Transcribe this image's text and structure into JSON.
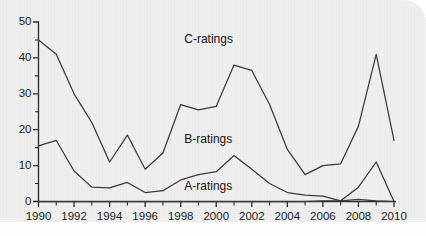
{
  "chart_data": {
    "type": "line",
    "title": "",
    "subtitle": "",
    "xlabel": "",
    "ylabel": "",
    "xlim": [
      1990,
      2010
    ],
    "ylim": [
      0,
      50
    ],
    "grid": false,
    "legend_position": "inline-annotations",
    "y_ticks_major": [
      0,
      10,
      20,
      30,
      40,
      50
    ],
    "y_ticks_minor": [
      5,
      15,
      25,
      35,
      45
    ],
    "x_ticks": [
      1990,
      1991,
      1992,
      1993,
      1994,
      1995,
      1996,
      1997,
      1998,
      1999,
      2000,
      2001,
      2002,
      2003,
      2004,
      2005,
      2006,
      2007,
      2008,
      2009,
      2010
    ],
    "x_tick_labels": [
      "1990",
      "",
      "1992",
      "",
      "1994",
      "",
      "1996",
      "",
      "1998",
      "",
      "2000",
      "",
      "2002",
      "",
      "2004",
      "",
      "2006",
      "",
      "2008",
      "",
      "2010"
    ],
    "x_labels_shown": [
      "1990",
      "1992",
      "1994",
      "1996",
      "1998",
      "2000",
      "2002",
      "2004",
      "2006",
      "2008",
      "2010"
    ],
    "y_tick_labels": [
      "0",
      "10",
      "20",
      "30",
      "40",
      "50"
    ],
    "line_color": "#3a3a3a",
    "axis_color": "#2b2b2b",
    "background_color": "#f0f0f0",
    "x": [
      1990,
      1991,
      1992,
      1993,
      1994,
      1995,
      1996,
      1997,
      1998,
      1999,
      2000,
      2001,
      2002,
      2003,
      2004,
      2005,
      2006,
      2007,
      2008,
      2009,
      2010
    ],
    "series": [
      {
        "name": "C-ratings",
        "label": "C-ratings",
        "label_x": 2000,
        "label_y": 45,
        "values": [
          45,
          41,
          30,
          22,
          11,
          18.5,
          9,
          13.5,
          27,
          25.5,
          26.5,
          38,
          36.5,
          27,
          14.5,
          7.5,
          10,
          10.5,
          21,
          41,
          17
        ]
      },
      {
        "name": "B-ratings",
        "label": "B-ratings",
        "label_x": 2000,
        "label_y": 17,
        "values": [
          15.5,
          17,
          8.5,
          4,
          3.8,
          5.3,
          2.5,
          3,
          6,
          7.5,
          8.3,
          12.8,
          9,
          5,
          2.5,
          1.8,
          1.5,
          0.2,
          4,
          11,
          0
        ]
      },
      {
        "name": "A-ratings",
        "label": "A-ratings",
        "label_x": 2000,
        "label_y": 4,
        "values": [
          0,
          0,
          0,
          0,
          0,
          0,
          0,
          0,
          0,
          0,
          0,
          0,
          0,
          0,
          0,
          0,
          0.2,
          0.2,
          0.6,
          0.2,
          0
        ]
      }
    ],
    "annotations": [
      {
        "text": "C-ratings",
        "x": 2000,
        "y": 45
      },
      {
        "text": "B-ratings",
        "x": 2000,
        "y": 17
      },
      {
        "text": "A-ratings",
        "x": 2000,
        "y": 4
      }
    ]
  }
}
